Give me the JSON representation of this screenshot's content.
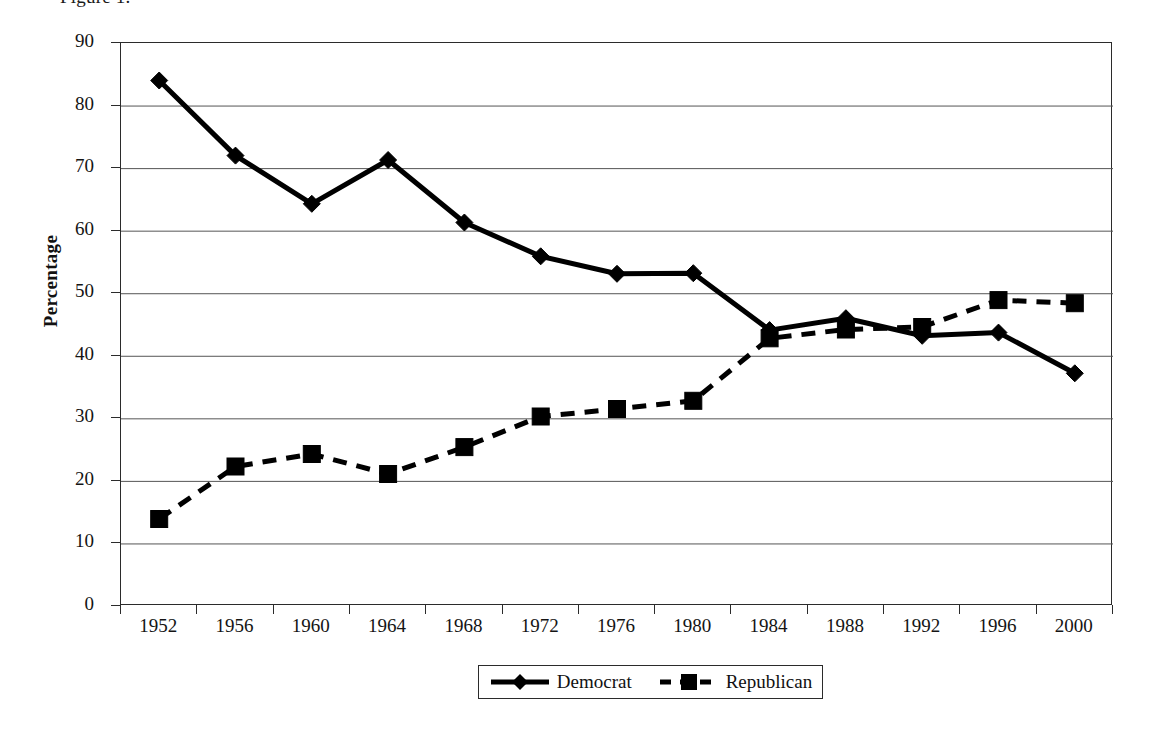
{
  "caption": "Figure 1.",
  "chart_data": {
    "type": "line",
    "title": "",
    "xlabel": "",
    "ylabel": "Percentage",
    "categories": [
      "1952",
      "1956",
      "1960",
      "1964",
      "1968",
      "1972",
      "1976",
      "1980",
      "1984",
      "1988",
      "1992",
      "1996",
      "2000"
    ],
    "x": [
      1952,
      1956,
      1960,
      1964,
      1968,
      1972,
      1976,
      1980,
      1984,
      1988,
      1992,
      1996,
      2000
    ],
    "ylim": [
      0,
      90
    ],
    "ytick_values": [
      0,
      10,
      20,
      30,
      40,
      50,
      60,
      70,
      80,
      90
    ],
    "ytick_labels": [
      "0",
      "10",
      "20",
      "30",
      "40",
      "50",
      "60",
      "70",
      "80",
      "90"
    ],
    "grid": "horizontal",
    "legend_position": "bottom",
    "series": [
      {
        "name": "Democrat",
        "marker": "diamond",
        "linestyle": "solid",
        "color": "#000000",
        "values": [
          84.0,
          72.0,
          64.3,
          71.3,
          61.3,
          55.9,
          53.1,
          53.2,
          44.1,
          46.0,
          43.2,
          43.7,
          37.2
        ]
      },
      {
        "name": "Republican",
        "marker": "square",
        "linestyle": "dashed",
        "color": "#000000",
        "values": [
          13.9,
          22.3,
          24.3,
          21.1,
          25.4,
          30.3,
          31.5,
          32.8,
          42.8,
          44.2,
          44.6,
          48.9,
          48.4
        ]
      }
    ]
  },
  "legend": {
    "items": [
      {
        "label": "Democrat",
        "key": "solid-line-diamond-marker"
      },
      {
        "label": "Republican",
        "key": "dashed-line-square-marker"
      }
    ]
  }
}
